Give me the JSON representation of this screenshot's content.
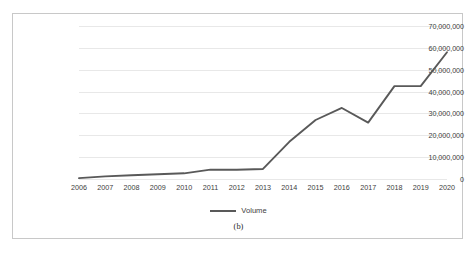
{
  "figure": {
    "caption": "(b)",
    "border_color": "#c8c8c8"
  },
  "legend": {
    "position": "bottom",
    "entries": [
      {
        "label": "Volume",
        "color": "#595959"
      }
    ]
  },
  "chart_data": {
    "type": "line",
    "title": "",
    "xlabel": "",
    "ylabel": "",
    "grid": "horizontal",
    "legend_position": "bottom",
    "categories": [
      "2006",
      "2007",
      "2008",
      "2009",
      "2010",
      "2011",
      "2012",
      "2013",
      "2014",
      "2015",
      "2016",
      "2017",
      "2018",
      "2019",
      "2020"
    ],
    "series": [
      {
        "name": "Volume",
        "color": "#595959",
        "values": [
          400000,
          1200000,
          1700000,
          2200000,
          2600000,
          4300000,
          4200000,
          4600000,
          17000000,
          27000000,
          32500000,
          25800000,
          42500000,
          42500000,
          58000000
        ]
      }
    ],
    "ylim": [
      0,
      70000000
    ],
    "ytick_values": [
      0,
      10000000,
      20000000,
      30000000,
      40000000,
      50000000,
      60000000,
      70000000
    ],
    "ytick_labels": [
      "0",
      "10,000,000",
      "20,000,000",
      "30,000,000",
      "40,000,000",
      "50,000,000",
      "60,000,000",
      "70,000,000"
    ]
  }
}
